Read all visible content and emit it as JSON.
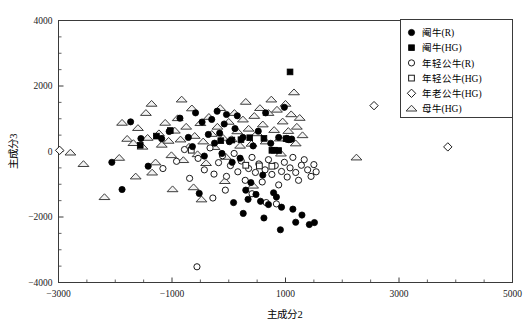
{
  "chart_data": {
    "type": "scatter",
    "title": "",
    "xlabel": "主成分2",
    "ylabel": "主成分3",
    "xlim": [
      -3000,
      5000
    ],
    "ylim": [
      -4000,
      4000
    ],
    "xticks": [
      -3000,
      -1000,
      1000,
      3000,
      5000
    ],
    "xtick_labels": [
      "-3000",
      "-1000",
      "1000",
      "3000",
      "5000"
    ],
    "yticks": [
      4000,
      2000,
      0,
      -2000,
      -4000
    ],
    "ytick_labels": [
      "4000",
      "2000",
      "0",
      "-2000",
      "-4000"
    ],
    "grid": false,
    "legend_position": "top-right",
    "series": [
      {
        "name": "阉牛(R)",
        "marker": "filled-circle",
        "color": "#000000",
        "points": [
          [
            -1729,
            905
          ],
          [
            -1548,
            396
          ],
          [
            -1420,
            -448
          ],
          [
            -1182,
            392
          ],
          [
            -1050,
            612
          ],
          [
            -860,
            1018
          ],
          [
            -712,
            430
          ],
          [
            -640,
            150
          ],
          [
            -585,
            1180
          ],
          [
            -470,
            900
          ],
          [
            -430,
            -140
          ],
          [
            -360,
            520
          ],
          [
            -300,
            980
          ],
          [
            -250,
            255
          ],
          [
            -205,
            1230
          ],
          [
            -160,
            560
          ],
          [
            -120,
            -60
          ],
          [
            -80,
            840
          ],
          [
            -40,
            1130
          ],
          [
            10,
            300
          ],
          [
            60,
            -330
          ],
          [
            110,
            700
          ],
          [
            150,
            1090
          ],
          [
            200,
            -205
          ],
          [
            250,
            430
          ],
          [
            300,
            -1180
          ],
          [
            340,
            -1460
          ],
          [
            390,
            -950
          ],
          [
            430,
            170
          ],
          [
            480,
            -1310
          ],
          [
            520,
            620
          ],
          [
            560,
            -1520
          ],
          [
            600,
            -720
          ],
          [
            650,
            1180
          ],
          [
            700,
            -1620
          ],
          [
            740,
            250
          ],
          [
            790,
            -1260
          ],
          [
            840,
            -1390
          ],
          [
            880,
            430
          ],
          [
            930,
            -1700
          ],
          [
            980,
            1350
          ],
          [
            1020,
            400
          ],
          [
            1060,
            360
          ],
          [
            1110,
            380
          ],
          [
            1180,
            -2160
          ],
          [
            1290,
            -1940
          ],
          [
            1420,
            -2230
          ],
          [
            1510,
            -2170
          ],
          [
            -2060,
            -330
          ],
          [
            -1880,
            -1160
          ],
          [
            -520,
            -1280
          ],
          [
            85,
            -1560
          ],
          [
            255,
            -1890
          ],
          [
            620,
            -2030
          ],
          [
            910,
            -2390
          ],
          [
            1130,
            -1760
          ]
        ]
      },
      {
        "name": "阉牛(HG)",
        "marker": "filled-square",
        "color": "#000000",
        "points": [
          [
            -1275,
            470
          ],
          [
            -1030,
            640
          ],
          [
            -140,
            330
          ],
          [
            55,
            350
          ],
          [
            370,
            420
          ],
          [
            620,
            400
          ],
          [
            1010,
            390
          ],
          [
            1055,
            370
          ],
          [
            1080,
            2430
          ],
          [
            760,
            35
          ],
          [
            805,
            40
          ],
          [
            880,
            30
          ],
          [
            -1560,
            190
          ],
          [
            215,
            360
          ]
        ]
      },
      {
        "name": "年轻公牛(R)",
        "marker": "open-circle",
        "color": "#1a1a1a",
        "points": [
          [
            -1160,
            -520
          ],
          [
            -920,
            -300
          ],
          [
            -780,
            60
          ],
          [
            -690,
            -820
          ],
          [
            -540,
            -210
          ],
          [
            -430,
            -560
          ],
          [
            -330,
            110
          ],
          [
            -260,
            -690
          ],
          [
            -180,
            -340
          ],
          [
            -110,
            -130
          ],
          [
            -40,
            -760
          ],
          [
            30,
            -430
          ],
          [
            95,
            -60
          ],
          [
            160,
            -620
          ],
          [
            220,
            -290
          ],
          [
            290,
            -880
          ],
          [
            350,
            -520
          ],
          [
            410,
            -180
          ],
          [
            470,
            -640
          ],
          [
            530,
            -380
          ],
          [
            590,
            -930
          ],
          [
            640,
            -560
          ],
          [
            700,
            -250
          ],
          [
            760,
            -700
          ],
          [
            820,
            -430
          ],
          [
            880,
            -1020
          ],
          [
            930,
            -610
          ],
          [
            980,
            -330
          ],
          [
            1030,
            -780
          ],
          [
            1080,
            -500
          ],
          [
            1130,
            -180
          ],
          [
            1180,
            -640
          ],
          [
            1230,
            -880
          ],
          [
            1280,
            -420
          ],
          [
            1330,
            -250
          ],
          [
            1390,
            -560
          ],
          [
            660,
            -1560
          ],
          [
            840,
            -1600
          ],
          [
            -560,
            -3520
          ],
          [
            1450,
            -760
          ],
          [
            1500,
            -400
          ],
          [
            1540,
            -620
          ],
          [
            410,
            -1290
          ],
          [
            -280,
            -1420
          ],
          [
            -60,
            -1180
          ]
        ]
      },
      {
        "name": "年轻公牛(HG)",
        "marker": "open-square",
        "color": "#1a1a1a",
        "points": [
          [
            540,
            -440
          ],
          [
            760,
            -450
          ],
          [
            -660,
            40
          ],
          [
            300,
            -420
          ]
        ]
      },
      {
        "name": "年老公牛(HG)",
        "marker": "open-diamond",
        "color": "#1a1a1a",
        "points": [
          [
            2560,
            1400
          ],
          [
            3860,
            140
          ],
          [
            -2980,
            35
          ]
        ]
      },
      {
        "name": "母牛(HG)",
        "marker": "open-triangle",
        "color": "#3c3c3c",
        "points": [
          [
            -2560,
            -380
          ],
          [
            -2190,
            -1390
          ],
          [
            -1930,
            -190
          ],
          [
            -1790,
            390
          ],
          [
            -1680,
            260
          ],
          [
            -1600,
            720
          ],
          [
            -1520,
            150
          ],
          [
            -1430,
            420
          ],
          [
            -1360,
            1460
          ],
          [
            -1290,
            -330
          ],
          [
            -1230,
            560
          ],
          [
            -1180,
            210
          ],
          [
            -1120,
            880
          ],
          [
            -1060,
            330
          ],
          [
            -1010,
            -110
          ],
          [
            -950,
            640
          ],
          [
            -900,
            1020
          ],
          [
            -850,
            370
          ],
          [
            -800,
            -260
          ],
          [
            -750,
            760
          ],
          [
            -700,
            150
          ],
          [
            -650,
            1320
          ],
          [
            -600,
            480
          ],
          [
            -550,
            -80
          ],
          [
            -500,
            870
          ],
          [
            -450,
            310
          ],
          [
            -400,
            -350
          ],
          [
            -350,
            1060
          ],
          [
            -300,
            540
          ],
          [
            -250,
            140
          ],
          [
            -200,
            760
          ],
          [
            -150,
            1330
          ],
          [
            -100,
            420
          ],
          [
            -50,
            -160
          ],
          [
            0,
            910
          ],
          [
            50,
            380
          ],
          [
            100,
            1180
          ],
          [
            150,
            620
          ],
          [
            200,
            180
          ],
          [
            250,
            980
          ],
          [
            300,
            1520
          ],
          [
            350,
            700
          ],
          [
            400,
            240
          ],
          [
            450,
            1090
          ],
          [
            500,
            560
          ],
          [
            550,
            1330
          ],
          [
            600,
            830
          ],
          [
            650,
            310
          ],
          [
            700,
            1180
          ],
          [
            750,
            1590
          ],
          [
            800,
            660
          ],
          [
            850,
            1280
          ],
          [
            900,
            400
          ],
          [
            950,
            920
          ],
          [
            1000,
            1460
          ],
          [
            1050,
            630
          ],
          [
            1100,
            1140
          ],
          [
            1150,
            1810
          ],
          [
            1200,
            760
          ],
          [
            1250,
            1030
          ],
          [
            1300,
            500
          ],
          [
            -1880,
            880
          ],
          [
            -1640,
            -760
          ],
          [
            -1350,
            -640
          ],
          [
            -990,
            -1150
          ],
          [
            -620,
            -1090
          ],
          [
            -480,
            -1460
          ],
          [
            2250,
            -180
          ],
          [
            -2790,
            -30
          ],
          [
            920,
            -60
          ],
          [
            1180,
            250
          ],
          [
            -70,
            -900
          ],
          [
            430,
            -1040
          ],
          [
            -830,
            1590
          ],
          [
            -1460,
            1180
          ]
        ]
      }
    ]
  },
  "legend": {
    "entries": [
      {
        "label": "阉牛(R)",
        "marker": "filled-circle"
      },
      {
        "label": "阉牛(HG)",
        "marker": "filled-square"
      },
      {
        "label": "年轻公牛(R)",
        "marker": "open-circle"
      },
      {
        "label": "年轻公牛(HG)",
        "marker": "open-square"
      },
      {
        "label": "年老公牛(HG)",
        "marker": "open-diamond"
      },
      {
        "label": "母牛(HG)",
        "marker": "open-triangle"
      }
    ]
  }
}
